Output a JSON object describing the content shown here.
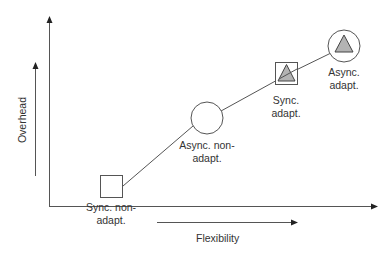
{
  "diagram": {
    "axes": {
      "y_label": "Overhead",
      "x_label": "Flexibility"
    },
    "colors": {
      "line": "#555555",
      "triangle_fill": "#b3b3b3",
      "shape_fill": "#ffffff",
      "text": "#333333"
    },
    "nodes": [
      {
        "id": "sync-non-adapt",
        "shape": "square",
        "has_triangle": false,
        "label_line1": "Sync. non-",
        "label_line2": "adapt."
      },
      {
        "id": "async-non-adapt",
        "shape": "circle",
        "has_triangle": false,
        "label_line1": "Async. non-",
        "label_line2": "adapt."
      },
      {
        "id": "sync-adapt",
        "shape": "square",
        "has_triangle": true,
        "label_line1": "Sync.",
        "label_line2": "adapt."
      },
      {
        "id": "async-adapt",
        "shape": "circle",
        "has_triangle": true,
        "label_line1": "Async.",
        "label_line2": "adapt."
      }
    ]
  }
}
